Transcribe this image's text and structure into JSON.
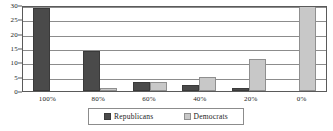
{
  "chart_data": {
    "type": "bar",
    "title": "",
    "xlabel": "",
    "ylabel": "",
    "categories": [
      "100%",
      "80%",
      "60%",
      "40%",
      "20%",
      "0%"
    ],
    "series": [
      {
        "name": "Republicans",
        "color": "#4a4a4a",
        "values": [
          29,
          14,
          3,
          2,
          1,
          0
        ]
      },
      {
        "name": "Democrats",
        "color": "#c8c8c8",
        "values": [
          0,
          1,
          3,
          5,
          11,
          30
        ]
      }
    ],
    "ylim": [
      0,
      30
    ],
    "yticks": [
      0,
      5,
      10,
      15,
      20,
      25,
      30
    ],
    "ytick_labels": [
      "0",
      "5",
      "10",
      "15",
      "20",
      "25",
      "30"
    ],
    "grid": true,
    "legend_position": "bottom-center"
  },
  "legend": {
    "items": [
      {
        "label": "Republicans",
        "swatch": "republicans-swatch"
      },
      {
        "label": "Democrats",
        "swatch": "democrats-swatch"
      }
    ]
  }
}
